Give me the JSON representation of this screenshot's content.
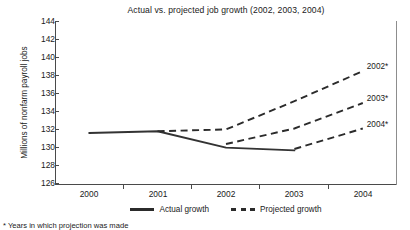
{
  "chart_data": {
    "type": "line",
    "title": "Actual vs. projected job growth (2002, 2003, 2004)",
    "xlabel": "",
    "ylabel": "Millions of nonfarm payroll jobs",
    "categories": [
      "2000",
      "2001",
      "2002",
      "2003",
      "2004"
    ],
    "ylim": [
      126,
      144
    ],
    "yticks": [
      126,
      128,
      130,
      132,
      134,
      136,
      138,
      140,
      142,
      144
    ],
    "grid": false,
    "legend_position": "bottom-center",
    "series": [
      {
        "name": "Actual growth",
        "style": "solid",
        "x": [
          "2000",
          "2001",
          "2002",
          "2003"
        ],
        "values": [
          131.7,
          131.9,
          130.1,
          129.8
        ]
      },
      {
        "name": "2002 projection",
        "label": "2002*",
        "style": "dashed",
        "x": [
          "2001",
          "2002",
          "2003",
          "2004"
        ],
        "values": [
          131.9,
          132.1,
          135.2,
          138.5
        ]
      },
      {
        "name": "2003 projection",
        "label": "2003*",
        "style": "dashed",
        "x": [
          "2002",
          "2003",
          "2004"
        ],
        "values": [
          130.5,
          132.2,
          135.0
        ]
      },
      {
        "name": "2004 projection",
        "label": "2004*",
        "style": "dashed",
        "x": [
          "2003",
          "2004"
        ],
        "values": [
          129.95,
          132.2
        ]
      }
    ],
    "annotations": [
      {
        "text": "2002*",
        "series": "2002 projection"
      },
      {
        "text": "2003*",
        "series": "2003 projection"
      },
      {
        "text": "2004*",
        "series": "2004 projection"
      }
    ]
  },
  "legend": {
    "entries": [
      {
        "label": "Actual growth",
        "style": "solid"
      },
      {
        "label": "Projected growth",
        "style": "dashed"
      }
    ]
  },
  "footnote": {
    "text": "* Years in which projection was made"
  },
  "colors": {
    "line": "#2b2b2b",
    "axis": "#4a4a4a",
    "background": "#ffffff"
  }
}
